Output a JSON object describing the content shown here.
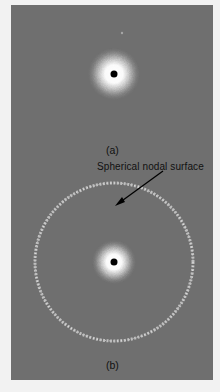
{
  "figure": {
    "panels": [
      {
        "id": "a",
        "caption": "(a)",
        "description": "1s orbital electron density: single dense cloud around nucleus"
      },
      {
        "id": "b",
        "caption": "(b)",
        "description": "2s orbital electron density: central cloud plus outer spherical shell"
      }
    ],
    "annotation": {
      "text": "Spherical nodal surface"
    },
    "colors": {
      "page_background": "#f2f2f2",
      "panel_background": "#6f6f6f",
      "density_dots": "#ffffff",
      "nucleus": "#000000",
      "text": "#111111"
    }
  }
}
